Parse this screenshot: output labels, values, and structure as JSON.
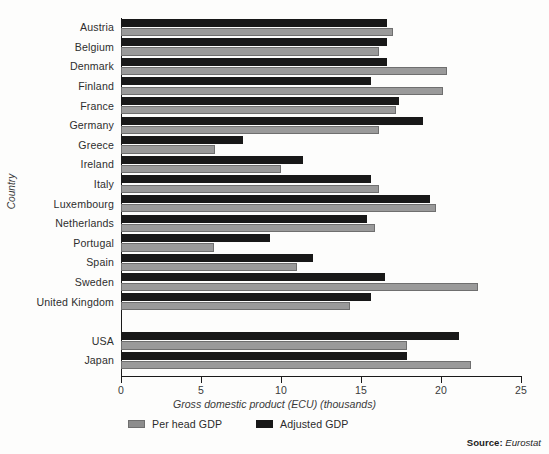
{
  "chart_data": {
    "type": "bar",
    "orientation": "horizontal",
    "title": "",
    "xlabel": "Gross domestic product (ECU) (thousands)",
    "ylabel": "Country",
    "xlim": [
      0,
      25
    ],
    "xticks": [
      0,
      5,
      10,
      15,
      20,
      25
    ],
    "xtick_labels": [
      "0",
      "5",
      "10",
      "15",
      "20",
      "25"
    ],
    "grid": false,
    "legend_position": "bottom-left",
    "categories": [
      "Austria",
      "Belgium",
      "Denmark",
      "Finland",
      "France",
      "Germany",
      "Greece",
      "Ireland",
      "Italy",
      "Luxembourg",
      "Netherlands",
      "Portugal",
      "Spain",
      "Sweden",
      "United Kingdom",
      "",
      "USA",
      "Japan"
    ],
    "series": [
      {
        "name": "Adjusted GDP",
        "color": "#181818",
        "values": [
          16.6,
          16.6,
          16.6,
          15.6,
          17.4,
          18.9,
          7.6,
          11.4,
          15.6,
          19.3,
          15.4,
          9.3,
          12.0,
          16.5,
          15.6,
          null,
          21.1,
          17.9
        ]
      },
      {
        "name": "Per head GDP",
        "color": "#9a9a9a",
        "values": [
          17.0,
          16.1,
          20.4,
          20.1,
          17.2,
          16.1,
          5.9,
          10.0,
          16.1,
          19.7,
          15.9,
          5.8,
          11.0,
          22.3,
          14.3,
          null,
          17.9,
          21.9
        ]
      }
    ]
  },
  "legend": {
    "items": [
      {
        "label": "Per head GDP",
        "swatch": "grey"
      },
      {
        "label": "Adjusted GDP",
        "swatch": "black"
      }
    ]
  },
  "source": {
    "label": "Source:",
    "value": "Eurostat"
  },
  "colors": {
    "adjusted": "#181818",
    "per_head": "#9a9a9a",
    "axis": "#1a1a1a",
    "background": "#fdfdfc"
  }
}
